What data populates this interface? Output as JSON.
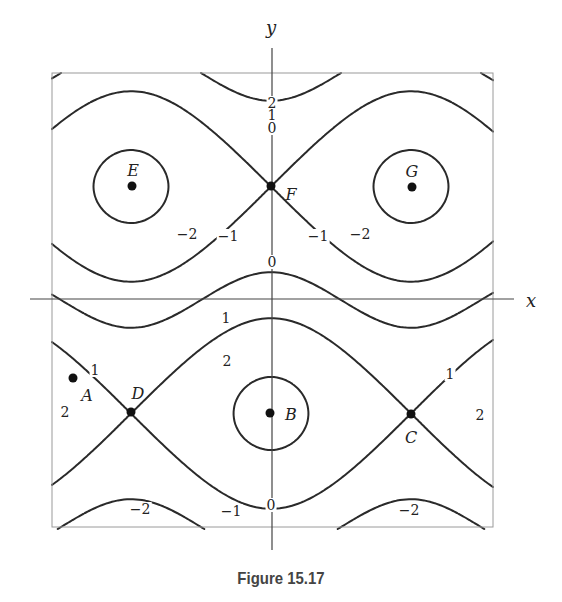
{
  "caption": "Figure 15.17",
  "chart_data": {
    "type": "contour",
    "title": "",
    "caption": "Figure 15.17",
    "xlabel": "x",
    "ylabel": "y",
    "grid": false,
    "plot_box_px": {
      "left": 52,
      "top": 73,
      "right": 493,
      "bottom": 527
    },
    "axes_px": {
      "x_axis_y": 299,
      "x_axis_from": 30,
      "x_axis_to": 514,
      "y_axis_x": 272,
      "y_axis_from": 48,
      "y_axis_to": 550
    },
    "model": {
      "description": "f = a*sin(w) + b*cos(u); u horizontal, w vertical (screen-down)",
      "a": 1.6,
      "b": 0.6,
      "u_center_px": 271,
      "u_half_period_px": 140,
      "w_center_px": 300,
      "w_half_period_px": 227
    },
    "contour_levels": [
      -3.0,
      -2.6,
      -2,
      -1,
      0,
      1,
      2,
      2.6,
      3.0
    ],
    "contour_labels": [
      {
        "text": "2",
        "x": 272,
        "y": 103
      },
      {
        "text": "1",
        "x": 272,
        "y": 115
      },
      {
        "text": "0",
        "x": 272,
        "y": 128
      },
      {
        "text": "−2",
        "x": 187,
        "y": 234
      },
      {
        "text": "−1",
        "x": 228,
        "y": 236
      },
      {
        "text": "−1",
        "x": 318,
        "y": 236
      },
      {
        "text": "−2",
        "x": 360,
        "y": 234
      },
      {
        "text": "0",
        "x": 272,
        "y": 262
      },
      {
        "text": "1",
        "x": 226,
        "y": 318
      },
      {
        "text": "2",
        "x": 227,
        "y": 361
      },
      {
        "text": "1",
        "x": 95,
        "y": 370
      },
      {
        "text": "2",
        "x": 65,
        "y": 412
      },
      {
        "text": "1",
        "x": 450,
        "y": 374
      },
      {
        "text": "2",
        "x": 480,
        "y": 415
      },
      {
        "text": "−2",
        "x": 140,
        "y": 509
      },
      {
        "text": "−1",
        "x": 231,
        "y": 511
      },
      {
        "text": "0",
        "x": 271,
        "y": 505
      },
      {
        "text": "−2",
        "x": 409,
        "y": 510
      }
    ],
    "points": [
      {
        "name": "A",
        "x": 73,
        "y": 378,
        "lx": 87,
        "ly": 395
      },
      {
        "name": "B",
        "x": 270,
        "y": 413,
        "lx": 291,
        "ly": 414
      },
      {
        "name": "C",
        "x": 411,
        "y": 414,
        "lx": 411,
        "ly": 437
      },
      {
        "name": "D",
        "x": 131,
        "y": 412,
        "lx": 138,
        "ly": 393
      },
      {
        "name": "E",
        "x": 132,
        "y": 186,
        "lx": 133,
        "ly": 170
      },
      {
        "name": "F",
        "x": 271,
        "y": 186,
        "lx": 291,
        "ly": 194
      },
      {
        "name": "G",
        "x": 412,
        "y": 187,
        "lx": 412,
        "ly": 171
      }
    ],
    "point_types": {
      "A": "regular point",
      "B": "local maximum",
      "C": "saddle",
      "D": "saddle",
      "E": "local minimum",
      "F": "saddle",
      "G": "local minimum"
    }
  },
  "colors": {
    "line": "#2a2a2a",
    "box": "#9a9a9a",
    "axis": "#444444",
    "caption": "#444444"
  }
}
